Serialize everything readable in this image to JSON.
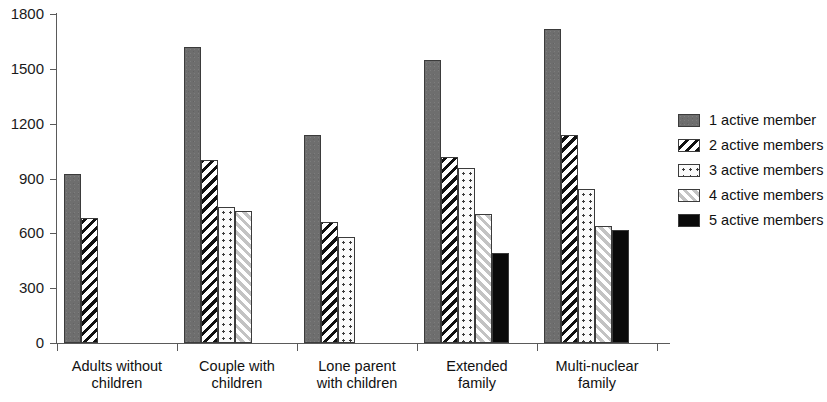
{
  "chart_data": {
    "type": "bar",
    "title": "",
    "subtitle": "",
    "xlabel": "",
    "ylabel": "",
    "ylim": [
      0,
      1800
    ],
    "yticks": [
      0,
      300,
      600,
      900,
      1200,
      1500,
      1800
    ],
    "grid": false,
    "legend_position": "right",
    "categories": [
      "Adults without\nchildren",
      "Couple with\nchildren",
      "Lone parent\nwith children",
      "Extended\nfamily",
      "Multi-nuclear\nfamily"
    ],
    "series": [
      {
        "name": "1 active member",
        "pattern": "solid-gray",
        "color": "#6e6e6e",
        "values": [
          925,
          1620,
          1140,
          1550,
          1720
        ]
      },
      {
        "name": "2 active members",
        "pattern": "hatch-dark",
        "color": "#111111",
        "values": [
          685,
          1000,
          660,
          1020,
          1140
        ]
      },
      {
        "name": "3 active members",
        "pattern": "dots",
        "color": "#3a3a3a",
        "values": [
          null,
          745,
          580,
          955,
          840
        ]
      },
      {
        "name": "4 active members",
        "pattern": "hatch-light",
        "color": "#c3c3c3",
        "values": [
          null,
          725,
          null,
          705,
          640
        ]
      },
      {
        "name": "5 active members",
        "pattern": "black",
        "color": "#0a0a0a",
        "values": [
          null,
          null,
          null,
          490,
          620
        ]
      }
    ]
  },
  "axis": {
    "y_tick_labels": [
      "0",
      "300",
      "600",
      "900",
      "1200",
      "1500",
      "1800"
    ]
  },
  "legend": {
    "items": [
      {
        "label": "1 active member"
      },
      {
        "label": "2 active members"
      },
      {
        "label": "3 active members"
      },
      {
        "label": "4 active members"
      },
      {
        "label": "5 active members"
      }
    ]
  }
}
